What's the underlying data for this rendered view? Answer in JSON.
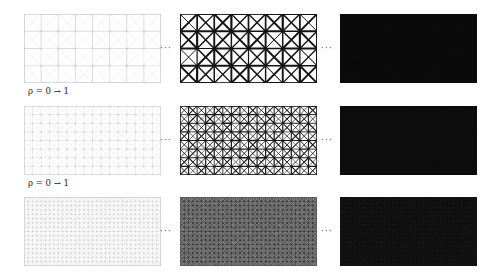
{
  "figure": {
    "type": "lattice-density-grid",
    "background_color": "#ffffff",
    "columns": 3,
    "rows": 3,
    "ellipsis_glyph": "···",
    "separator_name": "ellipsis-separator"
  },
  "labels": {
    "row1": "ρ = 0 → 1",
    "row2": "ρ = 0 → 1",
    "rho_symbol": "ρ",
    "from_value": "0",
    "to_value": "1",
    "arrow": "→"
  },
  "rows": [
    {
      "id": "row-coarse",
      "name": "mesh-level-1",
      "nx": 8,
      "ny": 4,
      "label": "ρ = 0 → 1",
      "panels": [
        {
          "name": "panel-row1-left",
          "density": 0.06,
          "stage": "initial",
          "line_color": "#b9b9be",
          "fill_color": "#ffffff",
          "max_line_width": 1.15,
          "diag_scale": 0.42,
          "border_color": "#c8c8cc",
          "caption": ""
        },
        {
          "name": "panel-row1-middle",
          "density": 0.52,
          "stage": "intermediate",
          "line_color": "#141414",
          "fill_color": "#ffffff",
          "max_line_width": 3.0,
          "diag_scale": 0.88,
          "border_color": "#141414",
          "caption": ""
        },
        {
          "name": "panel-row1-right",
          "density": 0.96,
          "stage": "converged",
          "line_color": "#0b0b0b",
          "fill_color": "#0b0b0b",
          "max_line_width": 5.2,
          "diag_scale": 1.0,
          "border_color": "#0b0b0b",
          "caption": ""
        }
      ]
    },
    {
      "id": "row-medium",
      "name": "mesh-level-2",
      "nx": 16,
      "ny": 8,
      "label": "ρ = 0 → 1",
      "panels": [
        {
          "name": "panel-row2-left",
          "density": 0.07,
          "stage": "initial",
          "line_color": "#bcbcc2",
          "fill_color": "#ffffff",
          "max_line_width": 0.72,
          "diag_scale": 0.4,
          "border_color": "#cacace",
          "caption": ""
        },
        {
          "name": "panel-row2-middle",
          "density": 0.55,
          "stage": "intermediate",
          "line_color": "#191919",
          "fill_color": "#ffffff",
          "max_line_width": 1.7,
          "diag_scale": 0.9,
          "border_color": "#191919",
          "caption": ""
        },
        {
          "name": "panel-row2-right",
          "density": 0.96,
          "stage": "converged",
          "line_color": "#0d0d0d",
          "fill_color": "#0d0d0d",
          "max_line_width": 2.8,
          "diag_scale": 1.0,
          "border_color": "#0d0d0d",
          "caption": ""
        }
      ]
    },
    {
      "id": "row-fine",
      "name": "mesh-level-3",
      "nx": 32,
      "ny": 16,
      "label": "",
      "panels": [
        {
          "name": "panel-row3-left",
          "density": 0.12,
          "stage": "initial",
          "line_color": "#b4b4ba",
          "fill_color": "#ffffff",
          "max_line_width": 0.55,
          "diag_scale": 0.55,
          "border_color": "#c6c6ca",
          "caption": ""
        },
        {
          "name": "panel-row3-middle",
          "density": 0.6,
          "stage": "intermediate",
          "line_color": "#3a3a3a",
          "fill_color": "#8d8d8d",
          "max_line_width": 1.0,
          "diag_scale": 0.92,
          "border_color": "#5a5a5a",
          "caption": ""
        },
        {
          "name": "panel-row3-right",
          "density": 0.95,
          "stage": "converged",
          "line_color": "#121212",
          "fill_color": "#1b1b1b",
          "max_line_width": 1.5,
          "diag_scale": 1.0,
          "border_color": "#121212",
          "caption": ""
        }
      ]
    }
  ],
  "geometry": {
    "panel_width": 137,
    "panel_height": 69,
    "panel_left_x": 24,
    "panel_mid_x": 180,
    "panel_right_x": 340,
    "row_tops": [
      14,
      106,
      197
    ],
    "ellipsis_x": [
      157,
      318
    ],
    "label_x": 28,
    "label_y_offsets": [
      86,
      178
    ]
  }
}
